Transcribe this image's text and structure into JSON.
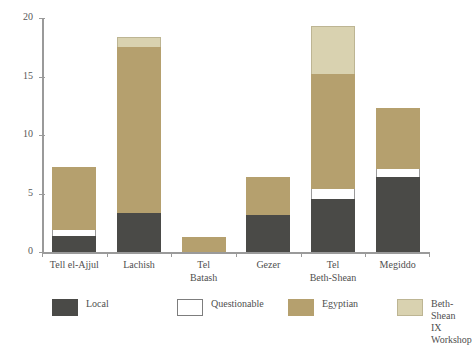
{
  "chart_data": {
    "type": "bar",
    "stacked": true,
    "title": "",
    "subtitle": "",
    "xlabel": "",
    "ylabel": "",
    "ylim": [
      0,
      20
    ],
    "yticks": [
      0,
      5,
      10,
      15,
      20
    ],
    "ytick_labels": [
      "0",
      "5",
      "10",
      "15",
      "20"
    ],
    "grid": false,
    "legend_position": "bottom",
    "categories": [
      "Tell el-Ajjul",
      "Lachish",
      "Tel\nBatash",
      "Gezer",
      "Tel\nBeth-Shean",
      "Megiddo"
    ],
    "series": [
      {
        "name": "Local",
        "color": "#4a4a47",
        "values": [
          1.4,
          3.3,
          0,
          3.2,
          4.5,
          6.4
        ]
      },
      {
        "name": "Questionable",
        "color": "#ffffff",
        "values": [
          0.5,
          0,
          0,
          0,
          0.9,
          0.7
        ]
      },
      {
        "name": "Egyptian",
        "color": "#b5a06e",
        "values": [
          5.4,
          14.2,
          1.3,
          3.2,
          9.8,
          5.2
        ]
      },
      {
        "name": "Beth-Shean\nIX Workshop",
        "color": "#d9d2b0",
        "values": [
          0,
          0.9,
          0,
          0,
          4.1,
          0
        ]
      }
    ],
    "totals": [
      7.3,
      18.4,
      1.3,
      6.4,
      19.3,
      12.3
    ]
  },
  "legend": {
    "items": [
      {
        "label": "Local",
        "color": "#4a4a47"
      },
      {
        "label": "Questionable",
        "color": "#ffffff"
      },
      {
        "label": "Egyptian",
        "color": "#b5a06e"
      },
      {
        "label": "Beth-Shean\nIX Workshop",
        "color": "#d9d2b0"
      }
    ]
  },
  "axes": {
    "y_tick_labels": [
      "20",
      "15",
      "10",
      "5",
      "0"
    ]
  }
}
